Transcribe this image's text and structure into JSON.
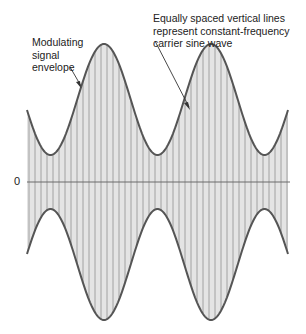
{
  "diagram": {
    "type": "amplitude-modulation",
    "labels": {
      "envelope": "Modulating\nsignal\nenvelope",
      "carrier": "Equally spaced vertical lines\nrepresent constant-frequency\ncarrier sine wave",
      "zero": "0"
    },
    "colors": {
      "fill": "#e4e4e4",
      "carrier_lines": "#9a9a9a",
      "envelope": "#555555",
      "axis": "#6a6a6a",
      "text": "#222222"
    },
    "geometry": {
      "x_start": 27,
      "x_end": 288,
      "zero_y": 182,
      "envelope_peaks_x": [
        104,
        211
      ],
      "envelope_valleys_x": [
        50,
        264
      ],
      "envelope_max_offset": 138,
      "envelope_min_offset": 27,
      "carrier_line_spacing": 6
    }
  }
}
